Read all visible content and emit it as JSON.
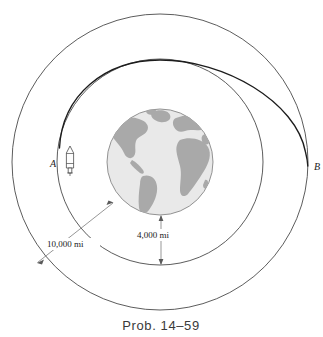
{
  "figure": {
    "caption": "Prob. 14–59",
    "title": "Prob. 14–59",
    "background_color": "#ffffff"
  },
  "earth": {
    "label": "Earth",
    "ocean_color": "#e9e9e9",
    "land_color": "#a9a9a9",
    "outline_color": "#7a7a7a",
    "center_x": 160,
    "center_y": 162,
    "radius": 53
  },
  "orbits": [
    {
      "name": "inner-orbit",
      "label": "inner circular orbit",
      "radius": 103,
      "stroke_color": "#4a4a4a"
    },
    {
      "name": "outer-orbit",
      "label": "outer circular orbit",
      "radius": 148,
      "stroke_color": "#4a4a4a"
    }
  ],
  "transfer": {
    "name": "transfer-ellipse",
    "label": "transfer trajectory",
    "stroke_color": "#1c1c1c"
  },
  "points": [
    {
      "id": "A",
      "label": "A",
      "x": 55,
      "y": 163,
      "description": "spacecraft at inner orbit"
    },
    {
      "id": "B",
      "label": "B",
      "x": 313,
      "y": 166,
      "description": "arrival point on outer orbit"
    }
  ],
  "spacecraft": {
    "name": "rocket",
    "label": "rocket",
    "x": 70,
    "y": 160
  },
  "dimensions": [
    {
      "id": "outer-radius-dim",
      "label": "10,000 mi",
      "value": 10000,
      "unit": "mi",
      "text_x": 47,
      "text_y": 247,
      "description": "radius of outer orbit from Earth center"
    },
    {
      "id": "earth-to-inner-dim",
      "label": "4,000 mi",
      "value": 4000,
      "unit": "mi",
      "text_x": 137,
      "text_y": 238,
      "description": "radius of Earth / gap to inner orbit"
    }
  ]
}
